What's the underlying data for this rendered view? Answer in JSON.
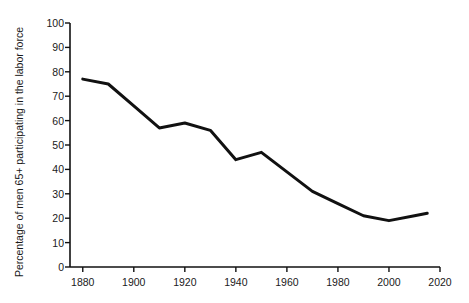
{
  "page": {
    "partial_top_text": "",
    "background_color": "#ffffff"
  },
  "chart_data": {
    "type": "line",
    "title": "",
    "xlabel": "",
    "ylabel": "Percentage of men 65+ participating in the labor force",
    "xlim": [
      1875,
      2020
    ],
    "ylim": [
      0,
      100
    ],
    "grid": false,
    "legend": false,
    "line_color": "#111111",
    "line_width": 3,
    "x_ticks": [
      "1880",
      "1900",
      "1920",
      "1940",
      "1960",
      "1980",
      "2000",
      "2020"
    ],
    "y_ticks": [
      "0",
      "10",
      "20",
      "30",
      "40",
      "50",
      "60",
      "70",
      "80",
      "90",
      "100"
    ],
    "x": [
      1880,
      1890,
      1900,
      1910,
      1920,
      1930,
      1940,
      1950,
      1960,
      1970,
      1980,
      1990,
      2000,
      2010,
      2015
    ],
    "values": [
      77,
      75,
      66,
      57,
      59,
      56,
      44,
      47,
      39,
      31,
      26,
      21,
      19,
      21,
      22
    ],
    "series": [
      {
        "name": "Percentage of men 65+ in the labor force",
        "values": [
          77,
          75,
          66,
          57,
          59,
          56,
          44,
          47,
          39,
          31,
          26,
          21,
          19,
          21,
          22
        ]
      }
    ]
  }
}
